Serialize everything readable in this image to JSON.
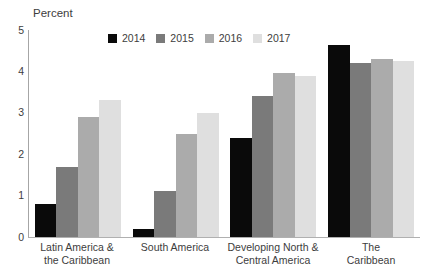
{
  "chart_data": {
    "type": "bar",
    "title": "",
    "xlabel": "",
    "ylabel": "Percent",
    "ylim": [
      0,
      5
    ],
    "yticks": [
      "0",
      "1",
      "2",
      "3",
      "4",
      "5"
    ],
    "grid": false,
    "legend_position": "top",
    "categories": [
      "Latin America & the Caribbean",
      "South America",
      "Developing North & Central America",
      "The Caribbean"
    ],
    "category_label_lines": [
      [
        "Latin America &",
        "the Caribbean"
      ],
      [
        "South America"
      ],
      [
        "Developing North &",
        "Central America"
      ],
      [
        "The",
        "Caribbean"
      ]
    ],
    "series": [
      {
        "name": "2014",
        "color": "#0a0a0a",
        "values": [
          0.8,
          0.2,
          2.4,
          4.65
        ]
      },
      {
        "name": "2015",
        "color": "#7a7a7a",
        "values": [
          1.7,
          1.1,
          3.4,
          4.2
        ]
      },
      {
        "name": "2016",
        "color": "#ababab",
        "values": [
          2.9,
          2.5,
          3.95,
          4.3
        ]
      },
      {
        "name": "2017",
        "color": "#dfdfdf",
        "values": [
          3.3,
          3.0,
          3.9,
          4.25
        ]
      }
    ],
    "axis_color": "#a6a6a6",
    "text_color": "#3d3d3d"
  }
}
